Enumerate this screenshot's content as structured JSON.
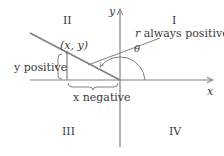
{
  "diagram": {
    "quadrants": {
      "q1": "I",
      "q2": "II",
      "q3": "III",
      "q4": "IV"
    },
    "axes": {
      "x_label": "x",
      "y_label": "y"
    },
    "point_label": "(x, y)",
    "angle_label": "θ",
    "annotations": {
      "r": "r always positive",
      "y": "y positive",
      "x": "x negative"
    },
    "colors": {
      "line": "#808080",
      "text": "#3a3a3a",
      "background": "#ffffff"
    }
  }
}
